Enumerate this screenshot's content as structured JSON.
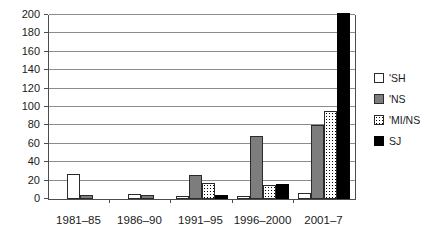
{
  "figure": {
    "background": "#ffffff"
  },
  "chart_data": {
    "type": "bar",
    "title": "",
    "xlabel": "",
    "ylabel": "",
    "categories": [
      "1981–85",
      "1986–90",
      "1991–95",
      "1996–2000",
      "2001–7"
    ],
    "series": [
      {
        "name": "'SH",
        "style": "sh",
        "values": [
          27,
          5,
          3,
          3,
          6
        ]
      },
      {
        "name": "'NS",
        "style": "ns",
        "values": [
          4,
          4,
          26,
          68,
          80
        ]
      },
      {
        "name": "'MI/NS",
        "style": "mins",
        "values": [
          0,
          0,
          17,
          15,
          96
        ]
      },
      {
        "name": "SJ",
        "style": "sj",
        "values": [
          0,
          0,
          4,
          16,
          202
        ]
      }
    ],
    "ylim": [
      0,
      200
    ],
    "y_ticks": [
      0,
      20,
      40,
      60,
      80,
      100,
      120,
      140,
      160,
      180,
      200
    ],
    "grid": true,
    "legend_position": "right",
    "colors": {
      "sh_fill": "#ffffff",
      "ns_fill": "#7d7d7d",
      "mins_dot": "#000000",
      "sj_fill": "#000000",
      "bar_border": "#2b2b2b",
      "gridline": "#8c8c8c",
      "axis": "#4d4d4d",
      "text": "#1a1a1a"
    }
  }
}
